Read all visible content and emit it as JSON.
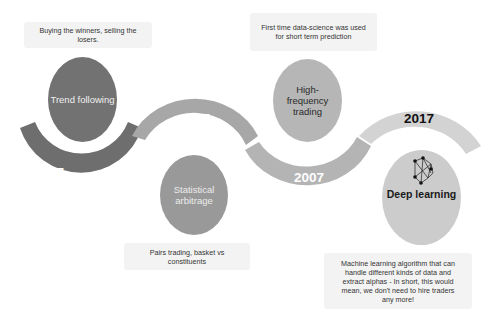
{
  "colors": {
    "arc_1987": "#6e6e6e",
    "arc_1997": "#a7a7a7",
    "arc_2007": "#b4b4b4",
    "arc_2017": "#d3d3d3",
    "bubble_trend": "#727272",
    "bubble_statarb": "#999999",
    "bubble_hft": "#b6b6b6",
    "bubble_deep": "#cccccc",
    "note_bg": "#f3f3f3"
  },
  "timeline": [
    {
      "year": "1987",
      "topic": "Trend following",
      "note": "Buying the winners, selling the losers."
    },
    {
      "year": "1997",
      "topic": "Statistical arbitrage",
      "note": "Pairs trading, basket vs constituents"
    },
    {
      "year": "2007",
      "topic_lines": [
        "High-",
        "frequency",
        "trading"
      ],
      "note": "First time data-science was used for short term prediction"
    },
    {
      "year": "2017",
      "topic": "Deep learning",
      "icon": "neural-network-icon",
      "note": "Machine learning algorithm that can handle different kinds of data and extract alphas - In short, this would mean, we don't need to hire traders any more!"
    }
  ]
}
